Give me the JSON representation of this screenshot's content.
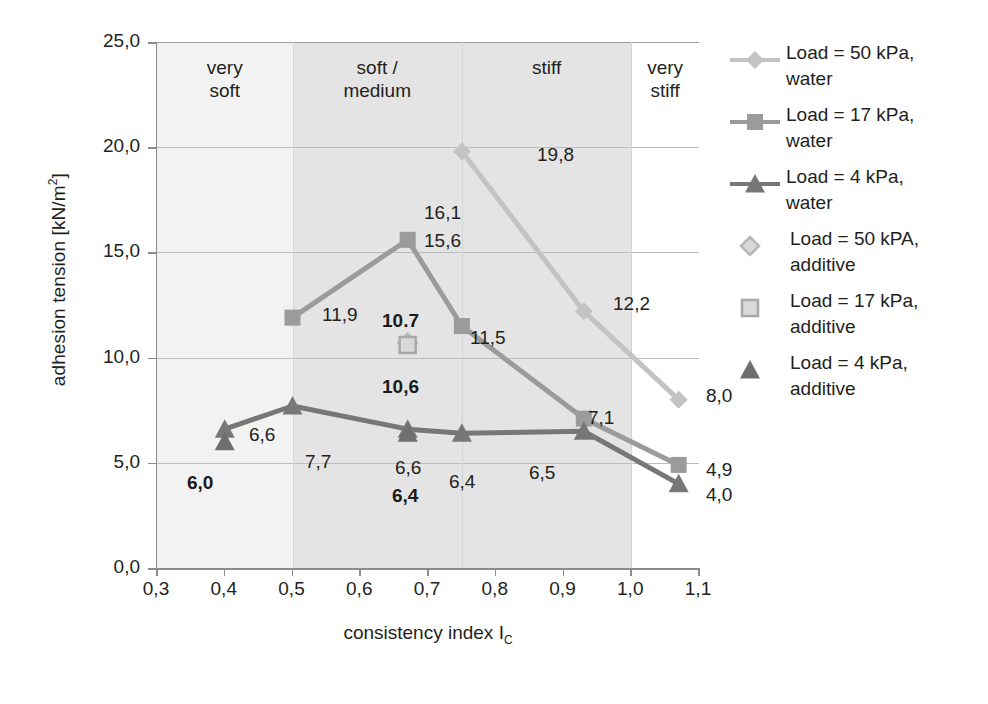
{
  "chart_data": {
    "type": "line",
    "title": "",
    "xlabel": "consistency index I",
    "xlabel_sub": "C",
    "ylabel": "adhesion tension [kN/m",
    "ylabel_sup": "2",
    "ylabel_tail": "]",
    "xlim": [
      0.3,
      1.1
    ],
    "ylim": [
      0.0,
      25.0
    ],
    "grid": true,
    "legend_position": "right",
    "xticks": [
      "0,3",
      "0,4",
      "0,5",
      "0,6",
      "0,7",
      "0,8",
      "0,9",
      "1,0",
      "1,1"
    ],
    "xtick_values": [
      0.3,
      0.4,
      0.5,
      0.6,
      0.7,
      0.8,
      0.9,
      1.0,
      1.1
    ],
    "yticks": [
      "0,0",
      "5,0",
      "10,0",
      "15,0",
      "20,0",
      "25,0"
    ],
    "ytick_values": [
      0,
      5,
      10,
      15,
      20,
      25
    ],
    "regions": [
      {
        "label": "very\nsoft",
        "line1": "very",
        "line2": "soft",
        "from": 0.3,
        "to": 0.5,
        "shade": "light"
      },
      {
        "label": "soft /\nmedium",
        "line1": "soft /",
        "line2": "medium",
        "from": 0.5,
        "to": 0.75,
        "shade": "dark"
      },
      {
        "label": "stiff",
        "line1": "stiff",
        "line2": "",
        "from": 0.75,
        "to": 1.0,
        "shade": "dark"
      },
      {
        "label": "very\nstiff",
        "line1": "very",
        "line2": "stiff",
        "from": 1.0,
        "to": 1.1,
        "shade": "white"
      }
    ],
    "series": [
      {
        "name": "Load = 50 kPa, water",
        "legend_line1": "Load = 50 kPa,",
        "legend_line2": "water",
        "marker": "diamond",
        "color": "#c3c3c3",
        "style": "line",
        "x": [
          0.75,
          0.93,
          1.07
        ],
        "values": [
          19.8,
          12.2,
          8.0
        ],
        "labels": [
          "19,8",
          "12,2",
          "8,0"
        ]
      },
      {
        "name": "Load = 17 kPa, water",
        "legend_line1": "Load = 17 kPa,",
        "legend_line2": "water",
        "marker": "square",
        "color": "#9b9b9b",
        "style": "line",
        "x": [
          0.5,
          0.67,
          0.75,
          0.93,
          1.07
        ],
        "values": [
          11.9,
          15.6,
          11.5,
          7.1,
          4.9
        ],
        "labels": [
          "11,9",
          "15,6",
          "11,5",
          "7,1",
          "4,9"
        ]
      },
      {
        "name": "Load = 4 kPa, water",
        "legend_line1": "Load = 4 kPa,",
        "legend_line2": "water",
        "marker": "triangle",
        "color": "#777777",
        "style": "line",
        "x": [
          0.4,
          0.5,
          0.67,
          0.75,
          0.93,
          1.07
        ],
        "values": [
          6.6,
          7.7,
          6.6,
          6.4,
          6.5,
          4.0
        ],
        "labels": [
          "6,6",
          "7,7",
          "6,6",
          "6,4",
          "6,5",
          "4,0"
        ]
      },
      {
        "name": "Load = 50 kPA, additive",
        "legend_line1": "Load = 50 kPA,",
        "legend_line2": "additive",
        "marker": "diamond-open",
        "color": "#b7b7b7",
        "style": "marker",
        "x": [
          0.67
        ],
        "values": [
          10.7
        ],
        "labels": [
          "10.7"
        ]
      },
      {
        "name": "Load = 17 kPa, additive",
        "legend_line1": "Load = 17 kPa,",
        "legend_line2": "additive",
        "marker": "square-open",
        "color": "#a8a8a8",
        "style": "marker",
        "x": [
          0.67
        ],
        "values": [
          10.6
        ],
        "labels": [
          "10,6"
        ]
      },
      {
        "name": "Load = 4 kPa, additive",
        "legend_line1": "Load = 4 kPa,",
        "legend_line2": "additive",
        "marker": "triangle-filled",
        "color": "#6e6e6e",
        "style": "marker",
        "x": [
          0.4,
          0.67
        ],
        "values": [
          6.0,
          6.4
        ],
        "labels": [
          "6,0",
          "6,4"
        ]
      }
    ],
    "point_labels": [
      {
        "text": "19,8",
        "x": 537,
        "y": 144,
        "bold": false
      },
      {
        "text": "16,1",
        "x": 424,
        "y": 202,
        "bold": false
      },
      {
        "text": "15,6",
        "x": 424,
        "y": 230,
        "bold": false
      },
      {
        "text": "12,2",
        "x": 613,
        "y": 293,
        "bold": false
      },
      {
        "text": "11,9",
        "x": 322,
        "y": 304,
        "bold": false
      },
      {
        "text": "11,5",
        "x": 470,
        "y": 327,
        "bold": false
      },
      {
        "text": "10.7",
        "x": 382,
        "y": 310,
        "bold": true
      },
      {
        "text": "10,6",
        "x": 382,
        "y": 376,
        "bold": true
      },
      {
        "text": "8,0",
        "x": 706,
        "y": 385,
        "bold": false
      },
      {
        "text": "7,7",
        "x": 305,
        "y": 451,
        "bold": false
      },
      {
        "text": "7,1",
        "x": 588,
        "y": 407,
        "bold": false
      },
      {
        "text": "6,6",
        "x": 249,
        "y": 424,
        "bold": false
      },
      {
        "text": "6,6",
        "x": 395,
        "y": 457,
        "bold": false
      },
      {
        "text": "6,5",
        "x": 529,
        "y": 462,
        "bold": false
      },
      {
        "text": "6,4",
        "x": 449,
        "y": 471,
        "bold": false
      },
      {
        "text": "6,4",
        "x": 392,
        "y": 485,
        "bold": true
      },
      {
        "text": "6,0",
        "x": 187,
        "y": 472,
        "bold": true
      },
      {
        "text": "4,9",
        "x": 706,
        "y": 459,
        "bold": false
      },
      {
        "text": "4,0",
        "x": 706,
        "y": 484,
        "bold": false
      }
    ]
  }
}
